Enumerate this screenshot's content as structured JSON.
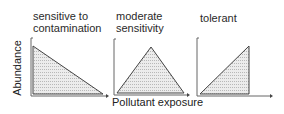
{
  "figure": {
    "y_axis_label": "Abundance",
    "x_axis_label": "Pollutant exposure",
    "colors": {
      "axis": "#555555",
      "fill": "#e2e2e2",
      "edge": "#444444"
    },
    "panels": [
      {
        "title_line1": "sensitive to",
        "title_line2": "contamination",
        "shape": "decreasing"
      },
      {
        "title_line1": "moderate",
        "title_line2": "sensitivity",
        "shape": "peak"
      },
      {
        "title_line1": "tolerant",
        "title_line2": "",
        "shape": "increasing"
      }
    ]
  }
}
